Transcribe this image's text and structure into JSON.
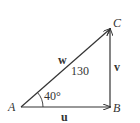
{
  "diagram": {
    "type": "right-triangle-vector-diagram",
    "vertices": [
      {
        "id": "A",
        "label": "A"
      },
      {
        "id": "B",
        "label": "B"
      },
      {
        "id": "C",
        "label": "C"
      }
    ],
    "vectors": [
      {
        "id": "u",
        "label": "u",
        "from": "A",
        "to": "B"
      },
      {
        "id": "v",
        "label": "v",
        "from": "B",
        "to": "C"
      },
      {
        "id": "w",
        "label": "w",
        "from": "A",
        "to": "C",
        "magnitude": "130"
      }
    ],
    "angle": {
      "at": "A",
      "label": "40°"
    },
    "colors": {
      "stroke": "#333333",
      "background": "#ffffff"
    }
  }
}
